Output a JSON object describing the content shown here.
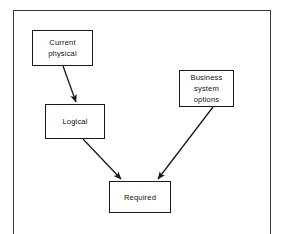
{
  "figure": {
    "type": "flow-diagram",
    "frame": {
      "visible": true,
      "border_color": "#3a3a3a"
    },
    "background_color": "#ffffff",
    "line_color": "#1a1a1a",
    "text_color": "#141414"
  },
  "nodes": [
    {
      "id": "current_physical",
      "label": "Current\nphysical",
      "x": 32,
      "y": 30,
      "w": 61,
      "h": 36
    },
    {
      "id": "logical",
      "label": "Logical",
      "x": 45,
      "y": 104,
      "w": 60,
      "h": 35
    },
    {
      "id": "business_options",
      "label": "Business\nsystem\noptions",
      "x": 179,
      "y": 70,
      "w": 55,
      "h": 37
    },
    {
      "id": "required",
      "label": "Required",
      "x": 109,
      "y": 181,
      "w": 62,
      "h": 32
    }
  ],
  "edges": [
    {
      "id": "edge_current_to_logical",
      "from": "current_physical",
      "to": "logical",
      "arrow": "end",
      "x1": 63,
      "y1": 66,
      "x2": 76,
      "y2": 103
    },
    {
      "id": "edge_logical_to_required",
      "from": "logical",
      "to": "required",
      "arrow": "end",
      "x1": 83,
      "y1": 139,
      "x2": 122,
      "y2": 180
    },
    {
      "id": "edge_options_to_required",
      "from": "business_options",
      "to": "required",
      "arrow": "end",
      "x1": 213,
      "y1": 107,
      "x2": 157,
      "y2": 180
    }
  ]
}
